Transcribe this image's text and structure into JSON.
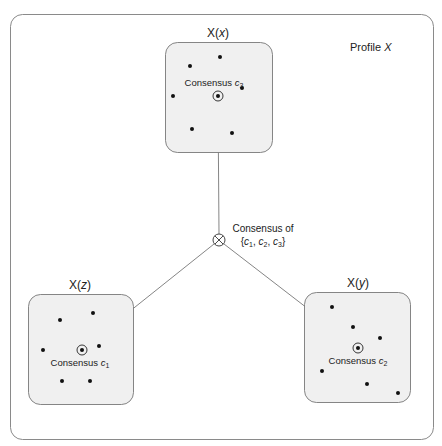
{
  "diagram": {
    "profile_label": "Profile X",
    "profile_label_parts": {
      "prefix": "Profile ",
      "var": "X"
    },
    "groups": [
      {
        "id": "x",
        "title": "X(x)",
        "title_parts": {
          "a": "X(",
          "b": "x",
          "c": ")"
        },
        "consensus_label": "Consensus c3",
        "consensus_parts": {
          "word": "Consensus ",
          "var": "c",
          "sub": "3"
        },
        "box": {
          "x": 165,
          "y": 42,
          "w": 107,
          "h": 110
        },
        "consensus_point": [
          218,
          96
        ],
        "points": [
          [
            220,
            57
          ],
          [
            190,
            66
          ],
          [
            173,
            96
          ],
          [
            242,
            88
          ],
          [
            192,
            129
          ],
          [
            232,
            133
          ]
        ]
      },
      {
        "id": "z",
        "title": "X(z)",
        "title_parts": {
          "a": "X(",
          "b": "z",
          "c": ")"
        },
        "consensus_label": "Consensus c1",
        "consensus_parts": {
          "word": "Consensus ",
          "var": "c",
          "sub": "1"
        },
        "box": {
          "x": 28,
          "y": 294,
          "w": 105,
          "h": 110
        },
        "consensus_point": [
          82,
          350
        ],
        "points": [
          [
            60,
            320
          ],
          [
            93,
            313
          ],
          [
            43,
            350
          ],
          [
            99,
            346
          ],
          [
            62,
            381
          ],
          [
            90,
            381
          ]
        ]
      },
      {
        "id": "y",
        "title": "X(y)",
        "title_parts": {
          "a": "X(",
          "b": "y",
          "c": ")"
        },
        "consensus_label": "Consensus c2",
        "consensus_parts": {
          "word": "Consensus ",
          "var": "c",
          "sub": "2"
        },
        "box": {
          "x": 304,
          "y": 292,
          "w": 106,
          "h": 110
        },
        "consensus_point": [
          358,
          348
        ],
        "points": [
          [
            332,
            307
          ],
          [
            353,
            327
          ],
          [
            380,
            338
          ],
          [
            322,
            371
          ],
          [
            367,
            384
          ],
          [
            398,
            393
          ]
        ]
      }
    ],
    "central_node": {
      "label_line1": "Consensus of",
      "label_line2": "{c1, c2, c3}",
      "center": [
        219,
        240
      ],
      "icon": "circled-times-icon"
    },
    "colors": {
      "frame": "#8a8a8a",
      "box_fill": "#f0f0f0",
      "box_stroke": "#777777",
      "dot": "#111111",
      "line": "#666666"
    }
  }
}
